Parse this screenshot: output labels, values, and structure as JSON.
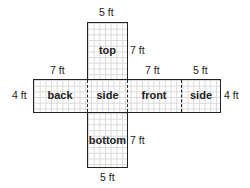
{
  "faces": {
    "top": "top",
    "back": "back",
    "side_left": "side",
    "front": "front",
    "side_right": "side",
    "bottom": "bottom"
  },
  "dimensions": {
    "top_width": "5 ft",
    "top_height": "7 ft",
    "back_width": "7 ft",
    "front_width": "7 ft",
    "side_width": "5 ft",
    "left_height": "4 ft",
    "right_height": "4 ft",
    "bottom_height": "7 ft",
    "bottom_width": "5 ft"
  }
}
